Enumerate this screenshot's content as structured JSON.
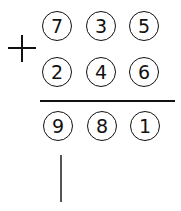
{
  "problem": {
    "operator": "+",
    "addend1": [
      "7",
      "3",
      "5"
    ],
    "addend2": [
      "2",
      "4",
      "6"
    ],
    "result": [
      "9",
      "8",
      "1"
    ]
  }
}
